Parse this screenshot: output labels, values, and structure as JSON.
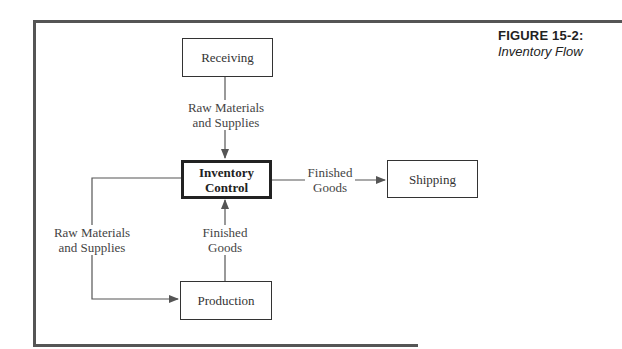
{
  "figure": {
    "number_label": "FIGURE  15-2:",
    "title": "Inventory Flow"
  },
  "nodes": {
    "receiving": "Receiving",
    "inventory_control_line1": "Inventory",
    "inventory_control_line2": "Control",
    "shipping": "Shipping",
    "production": "Production"
  },
  "edges": {
    "receiving_to_ic": {
      "line1": "Raw Materials",
      "line2": "and Supplies"
    },
    "ic_to_shipping": {
      "line1": "Finished",
      "line2": "Goods"
    },
    "ic_to_production": {
      "line1": "Raw Materials",
      "line2": "and Supplies"
    },
    "production_to_ic": {
      "line1": "Finished",
      "line2": "Goods"
    }
  },
  "colors": {
    "line": "#555555",
    "text": "#333333",
    "background": "#ffffff"
  }
}
